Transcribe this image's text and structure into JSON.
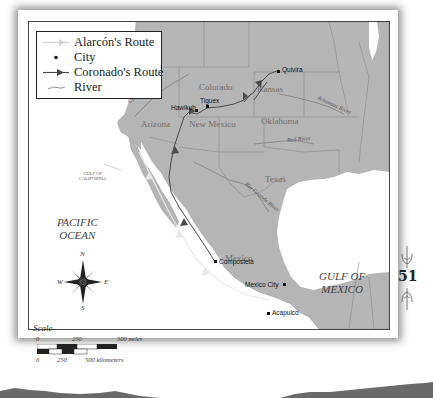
{
  "legend": {
    "items": [
      {
        "symbol": "light-arrow-line",
        "label": "Alarcón's Route"
      },
      {
        "symbol": "dot",
        "label": "City"
      },
      {
        "symbol": "dark-arrow-line",
        "label": "Coronado's Route"
      },
      {
        "symbol": "wavy-line",
        "label": "River"
      }
    ]
  },
  "states": {
    "colorado": "Colorado",
    "kansas": "Kansas",
    "arizona": "Arizona",
    "new_mexico": "New Mexico",
    "oklahoma": "Oklahoma",
    "texas": "Texas",
    "mexico": "Mexico"
  },
  "cities": {
    "quivira": "Quivira",
    "tiguex": "Tiguex",
    "hawikuh": "Hawikuh",
    "compostela": "Compostela",
    "mexico_city": "Mexico City",
    "acapulco": "Acapulco"
  },
  "rivers": {
    "colorado": "Colorado River",
    "arkansas": "Arkansas River",
    "red": "Red River",
    "rio_grande": "Rio Grande River"
  },
  "water_bodies": {
    "gulf_of_california_line1": "GULF OF",
    "gulf_of_california_line2": "CALIFORNIA",
    "pacific_line1": "PACIFIC",
    "pacific_line2": "OCEAN",
    "gulf_of_mexico_line1": "GULF OF",
    "gulf_of_mexico_line2": "MEXICO"
  },
  "compass": {
    "n": "N",
    "s": "S",
    "e": "E",
    "w": "W"
  },
  "scale": {
    "title": "Scale",
    "miles_0": "0",
    "miles_250": "250",
    "miles_500": "500 miles",
    "km_0": "0",
    "km_250": "250",
    "km_500": "500 kilometers"
  },
  "page_number": "51",
  "colors": {
    "land": "#b5b5b5",
    "water": "#ffffff",
    "coronado_route": "#4a4a4a",
    "alarcon_route": "#e0e0e0",
    "border": "#8a8a8a"
  }
}
